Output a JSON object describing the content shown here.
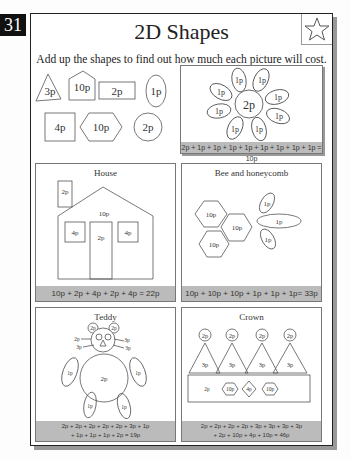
{
  "page_number": "31",
  "title": "2D Shapes",
  "star_icon": "star-outline-icon",
  "instructions": "Add up the shapes to find out how much each picture will cost.",
  "price_key": [
    {
      "shape": "triangle",
      "value": "3p"
    },
    {
      "shape": "pentagon",
      "value": "10p"
    },
    {
      "shape": "rectangle",
      "value": "2p"
    },
    {
      "shape": "oval",
      "value": "1p"
    },
    {
      "shape": "square",
      "value": "4p"
    },
    {
      "shape": "hexagon",
      "value": "10p"
    },
    {
      "shape": "circle",
      "value": "2p"
    }
  ],
  "pictures": [
    {
      "name": "Flower",
      "title": "",
      "labels": {
        "center": "2p",
        "petal": "1p"
      },
      "equation": "2p + 1p + 1p + 1p + 1p + 1p + 1p + 1p + 1p = 10p"
    },
    {
      "name": "House",
      "title": "House",
      "labels": {
        "chimney": "2p",
        "roof": "10p",
        "window_left": "4p",
        "door": "2p",
        "window_right": "4p"
      },
      "equation": "10p + 2p + 4p + 2p + 4p = 22p"
    },
    {
      "name": "Bee and honeycomb",
      "title": "Bee and honeycomb",
      "labels": {
        "hex1": "10p",
        "hex2": "10p",
        "hex3": "10p",
        "wing_top": "1p",
        "body": "1p",
        "wing_bottom": "1p"
      },
      "equation": "10p + 10p + 10p + 1p + 1p + 1p= 33p"
    },
    {
      "name": "Teddy",
      "title": "Teddy",
      "labels": {
        "ear": "2p",
        "eye": "2p",
        "face_left": "2p",
        "face_right": "3p",
        "nose": "3p",
        "body": "2p",
        "limb": "1p"
      },
      "equation_line1": "2p + 2p + 2p + 2p + 2p + 3p + 1p",
      "equation_line2": "+ 1p + 1p + 1p + 2p = 19p"
    },
    {
      "name": "Crown",
      "title": "Crown",
      "labels": {
        "jewel": "2p",
        "point": "3p",
        "band_rect": "2p",
        "band_hex1": "10p",
        "band_diamond": "4p",
        "band_hex2": "10p"
      },
      "equation_line1": "2p + 2p + 2p + 2p + 3p + 3p + 3p + 3p",
      "equation_line2": "+ 2p + 10p + 4p + 10p = 46p"
    }
  ]
}
